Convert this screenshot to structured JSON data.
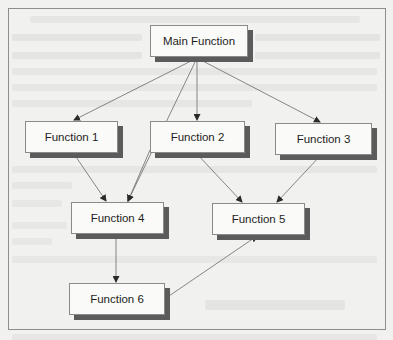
{
  "diagram": {
    "type": "flowchart",
    "title": "",
    "nodes": [
      {
        "id": "main",
        "label": "Main Function",
        "x": 150,
        "y": 25,
        "w": 98,
        "h": 32
      },
      {
        "id": "f1",
        "label": "Function 1",
        "x": 25,
        "y": 121,
        "w": 93,
        "h": 32
      },
      {
        "id": "f2",
        "label": "Function 2",
        "x": 150,
        "y": 121,
        "w": 95,
        "h": 32
      },
      {
        "id": "f3",
        "label": "Function 3",
        "x": 275,
        "y": 123,
        "w": 97,
        "h": 32
      },
      {
        "id": "f4",
        "label": "Function 4",
        "x": 71,
        "y": 202,
        "w": 93,
        "h": 32
      },
      {
        "id": "f5",
        "label": "Function 5",
        "x": 212,
        "y": 203,
        "w": 93,
        "h": 32
      },
      {
        "id": "f6",
        "label": "Function 6",
        "x": 69,
        "y": 283,
        "w": 96,
        "h": 32
      }
    ],
    "edges": [
      {
        "from": "main",
        "to": "f1",
        "x1": 197,
        "y1": 58,
        "x2": 74,
        "y2": 120
      },
      {
        "from": "main",
        "to": "f2",
        "x1": 197,
        "y1": 58,
        "x2": 197,
        "y2": 120
      },
      {
        "from": "main",
        "to": "f3",
        "x1": 197,
        "y1": 58,
        "x2": 320,
        "y2": 122
      },
      {
        "from": "main",
        "to": "f4",
        "x1": 197,
        "y1": 58,
        "x2": 128,
        "y2": 201
      },
      {
        "from": "f1",
        "to": "f4",
        "x1": 74,
        "y1": 154,
        "x2": 106,
        "y2": 201
      },
      {
        "from": "f2",
        "to": "f4",
        "x1": 150,
        "y1": 150,
        "x2": 128,
        "y2": 201
      },
      {
        "from": "f2",
        "to": "f5",
        "x1": 197,
        "y1": 154,
        "x2": 242,
        "y2": 202
      },
      {
        "from": "f3",
        "to": "f5",
        "x1": 320,
        "y1": 156,
        "x2": 277,
        "y2": 202
      },
      {
        "from": "f4",
        "to": "f6",
        "x1": 116,
        "y1": 235,
        "x2": 116,
        "y2": 282
      },
      {
        "from": "f6",
        "to": "f5",
        "x1": 166,
        "y1": 298,
        "x2": 257,
        "y2": 236
      }
    ],
    "colors": {
      "page": "#f1f1ef",
      "box_fill": "#fafaf8",
      "box_border": "#8a8a88",
      "box_shadow": "#5b5b5b",
      "edge": "#6a6a6a",
      "frame": "#8e8e8c"
    }
  }
}
